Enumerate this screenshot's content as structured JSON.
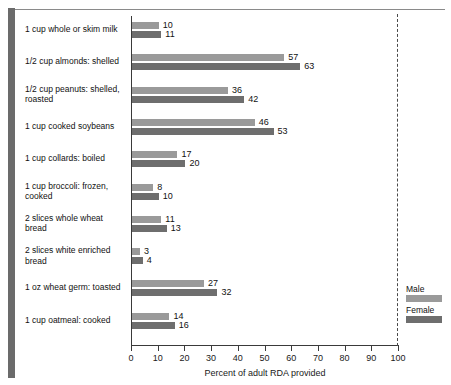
{
  "chart_data": {
    "type": "bar",
    "title": "",
    "xlabel": "Percent of adult RDA provided",
    "ylabel": "",
    "xlim": [
      0,
      100
    ],
    "xticks": [
      0,
      10,
      20,
      30,
      40,
      50,
      60,
      70,
      80,
      90,
      100
    ],
    "grid": false,
    "orientation": "horizontal",
    "legend_position": "right-bottom",
    "reference_line": 100,
    "categories": [
      "1 cup whole or skim milk",
      "1/2 cup almonds:  shelled",
      "1/2 cup peanuts:  shelled,\nroasted",
      "1 cup cooked soybeans",
      "1 cup collards:  boiled",
      "1 cup broccoli:  frozen,\ncooked",
      "2 slices whole wheat\nbread",
      "2 slices white enriched\nbread",
      "1 oz wheat germ:  toasted",
      "1 cup oatmeal:  cooked"
    ],
    "series": [
      {
        "name": "Male",
        "color": "#9a9a9a",
        "values": [
          10,
          57,
          36,
          46,
          17,
          8,
          11,
          3,
          27,
          14
        ]
      },
      {
        "name": "Female",
        "color": "#6e6e6e",
        "values": [
          11,
          63,
          42,
          53,
          20,
          10,
          13,
          4,
          32,
          16
        ]
      }
    ]
  },
  "legend": {
    "entries": [
      {
        "label": "Male"
      },
      {
        "label": "Female"
      }
    ]
  },
  "axis": {
    "title": "Percent of adult RDA provided"
  }
}
